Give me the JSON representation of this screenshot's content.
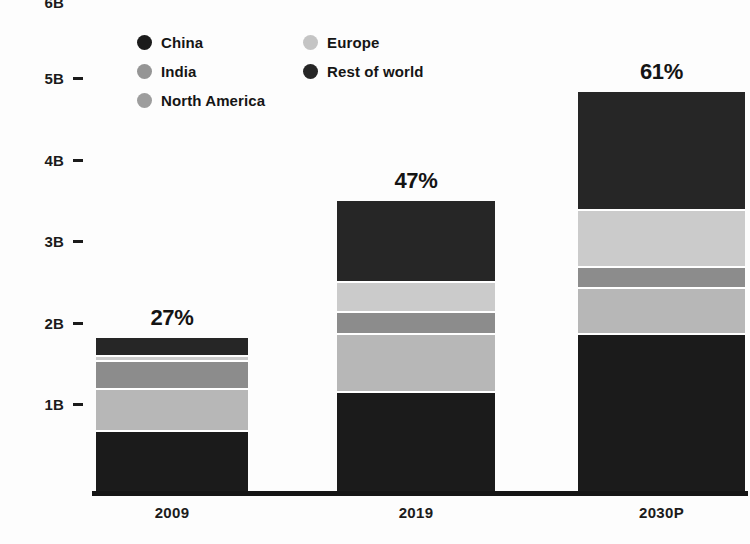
{
  "chart_data": {
    "type": "bar",
    "subtype": "stacked-bar",
    "title": "",
    "subtitle": "",
    "xlabel": "",
    "ylabel": "",
    "categories": [
      "2009",
      "2019",
      "2030P"
    ],
    "ylim": [
      0,
      5.4
    ],
    "y_ticks": [
      {
        "label": "6B",
        "value": 6
      },
      {
        "label": "5B",
        "value": 5
      },
      {
        "label": "4B",
        "value": 4
      },
      {
        "label": "3B",
        "value": 3
      },
      {
        "label": "2B",
        "value": 2
      },
      {
        "label": "1B",
        "value": 1
      }
    ],
    "grid": false,
    "legend_position": "top-left",
    "series": [
      {
        "name": "China",
        "color": "#1b1b1b",
        "values": [
          0.72,
          1.2,
          1.92
        ]
      },
      {
        "name": "India",
        "color": "#b7b7b7",
        "values": [
          0.52,
          0.72,
          0.56
        ]
      },
      {
        "name": "North America",
        "color": "#8c8c8c",
        "values": [
          0.34,
          0.27,
          0.26
        ]
      },
      {
        "name": "Europe",
        "color": "#cbcbcb",
        "values": [
          0.06,
          0.36,
          0.69
        ]
      },
      {
        "name": "Rest of world",
        "color": "#262626",
        "values": [
          0.24,
          1.01,
          1.47
        ]
      }
    ],
    "totals": [
      1.88,
      3.56,
      4.9
    ],
    "bar_value_labels": [
      "27%",
      "47%",
      "61%"
    ],
    "annotations": [
      {
        "category": "2009",
        "text": "27%"
      },
      {
        "category": "2019",
        "text": "47%"
      },
      {
        "category": "2030P",
        "text": "61%"
      }
    ]
  },
  "legend": {
    "columns": [
      {
        "items": [
          {
            "label": "China",
            "color": "#1b1b1b",
            "marker": "circle-marker"
          },
          {
            "label": "India",
            "color": "#959595",
            "marker": "circle-marker"
          },
          {
            "label": "North America",
            "color": "#9d9d9d",
            "marker": "circle-marker"
          }
        ]
      },
      {
        "items": [
          {
            "label": "Europe",
            "color": "#c4c4c4",
            "marker": "circle-marker"
          },
          {
            "label": "Rest of world",
            "color": "#262626",
            "marker": "circle-marker"
          }
        ]
      }
    ]
  },
  "axis": {
    "y_labels": [
      "6B",
      "5B",
      "4B",
      "3B",
      "2B",
      "1B"
    ],
    "x_labels": [
      "2009",
      "2019",
      "2030P"
    ]
  },
  "colors": {
    "background": "#fdfdfd",
    "axis": "#151515",
    "text": "#1b1b1b",
    "separator": "#ffffff"
  }
}
